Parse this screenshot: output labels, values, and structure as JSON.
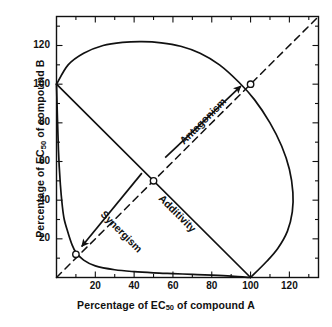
{
  "chart_data": {
    "type": "line",
    "title": "",
    "xlabel_parts": {
      "pre": "Percentage of EC",
      "sub": "50",
      "post": " of compound A"
    },
    "ylabel_parts": {
      "pre": "Percentage of EC",
      "sub": "50",
      "post": " of compound B"
    },
    "xlabel": "Percentage of EC50 of compound A",
    "ylabel": "Percentage of EC50 of compound B",
    "xlim": [
      0,
      135
    ],
    "ylim": [
      0,
      135
    ],
    "grid": false,
    "legend_position": "none",
    "x_major_ticks": [
      20,
      40,
      60,
      80,
      100,
      120
    ],
    "y_major_ticks": [
      20,
      40,
      60,
      80,
      100,
      120
    ],
    "x_minor_ticks": [
      10,
      30,
      50,
      70,
      90,
      110,
      130
    ],
    "y_minor_ticks": [
      10,
      30,
      50,
      70,
      90,
      110,
      130
    ],
    "x_tick_labels": [
      "20",
      "40",
      "60",
      "80",
      "100",
      "120"
    ],
    "y_tick_labels": [
      "20",
      "40",
      "60",
      "80",
      "100",
      "120"
    ],
    "series": [
      {
        "name": "Additivity",
        "style": "solid",
        "points": [
          [
            0,
            100
          ],
          [
            100,
            0
          ]
        ]
      },
      {
        "name": "Line of identity",
        "style": "dashed",
        "points": [
          [
            0,
            0
          ],
          [
            135,
            135
          ]
        ]
      },
      {
        "name": "Synergism",
        "style": "solid",
        "points": [
          [
            0,
            100
          ],
          [
            1,
            66
          ],
          [
            2,
            48
          ],
          [
            3,
            37
          ],
          [
            4,
            30
          ],
          [
            6,
            23
          ],
          [
            8,
            17
          ],
          [
            10,
            13
          ],
          [
            14,
            9
          ],
          [
            20,
            6
          ],
          [
            30,
            4
          ],
          [
            40,
            3
          ],
          [
            50,
            2.4
          ],
          [
            60,
            2
          ],
          [
            70,
            1.6
          ],
          [
            80,
            1.2
          ],
          [
            90,
            0.7
          ],
          [
            100,
            0
          ]
        ]
      },
      {
        "name": "Antagonism",
        "style": "solid",
        "points": [
          [
            0,
            100
          ],
          [
            6,
            110
          ],
          [
            14,
            116
          ],
          [
            24,
            120
          ],
          [
            34,
            121.6
          ],
          [
            44,
            122
          ],
          [
            54,
            121.4
          ],
          [
            64,
            119.6
          ],
          [
            74,
            116
          ],
          [
            84,
            110
          ],
          [
            94,
            101
          ],
          [
            102,
            92
          ],
          [
            110,
            80
          ],
          [
            116,
            68
          ],
          [
            120,
            56
          ],
          [
            121.8,
            44
          ],
          [
            121.5,
            34
          ],
          [
            119,
            24
          ],
          [
            114,
            15
          ],
          [
            108,
            8
          ],
          [
            100,
            0
          ]
        ]
      }
    ],
    "markers": [
      {
        "label": "synergism-point",
        "x": 10,
        "y": 12
      },
      {
        "label": "additivity-point",
        "x": 50,
        "y": 50
      },
      {
        "label": "antagonism-point",
        "x": 100,
        "y": 100
      }
    ],
    "annotations": [
      {
        "label": "Synergism",
        "x": 26,
        "y": 36,
        "rotation": 45,
        "arrow_from": [
          44,
          54
        ],
        "arrow_to": [
          13,
          16
        ]
      },
      {
        "label": "Antagonism",
        "x": 62,
        "y": 72,
        "rotation": -45,
        "arrow_from": [
          56,
          62
        ],
        "arrow_to": [
          95,
          99
        ]
      },
      {
        "label": "Additivity",
        "x": 56,
        "y": 44,
        "rotation": 45
      }
    ]
  }
}
